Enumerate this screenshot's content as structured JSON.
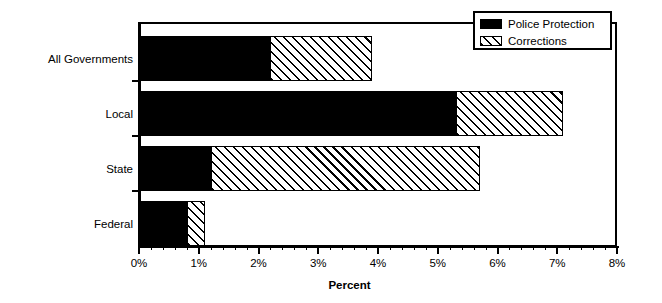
{
  "chart_data": {
    "type": "bar",
    "orientation": "horizontal",
    "stacked": true,
    "title": "",
    "xlabel": "Percent",
    "ylabel": "",
    "categories": [
      "All Governments",
      "Local",
      "State",
      "Federal"
    ],
    "series": [
      {
        "name": "Police Protection",
        "fill": "solid-black",
        "color": "#000000",
        "values": [
          2.2,
          5.3,
          1.2,
          0.8
        ]
      },
      {
        "name": "Corrections",
        "fill": "diagonal-hatch",
        "color": "#ffffff",
        "values": [
          1.7,
          1.8,
          4.5,
          0.3
        ]
      }
    ],
    "totals": [
      3.9,
      7.1,
      5.7,
      1.1
    ],
    "xlim": [
      0,
      8
    ],
    "xticks": [
      0,
      1,
      2,
      3,
      4,
      5,
      6,
      7,
      8
    ],
    "xtick_labels": [
      "0%",
      "1%",
      "2%",
      "3%",
      "4%",
      "5%",
      "6%",
      "7%",
      "8%"
    ],
    "minor_tick_interval": 0.2,
    "grid": false,
    "legend_position": "top-right"
  },
  "legend": {
    "entries": [
      {
        "label": "Police Protection"
      },
      {
        "label": "Corrections"
      }
    ]
  },
  "axis": {
    "x_title": "Percent"
  }
}
